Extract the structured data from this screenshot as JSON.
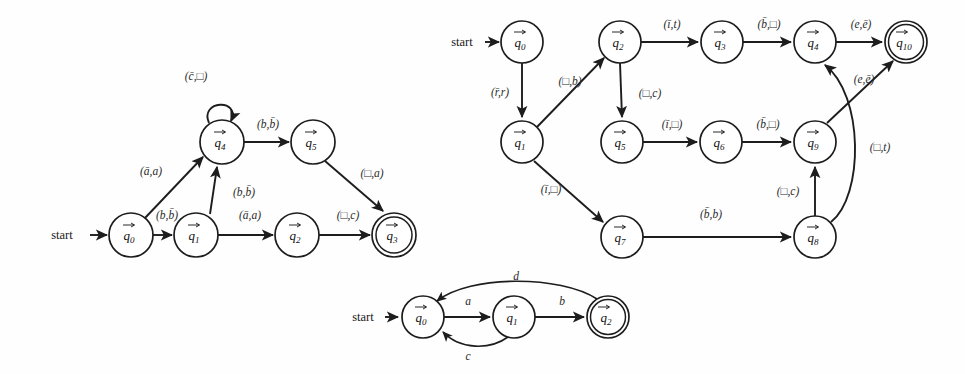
{
  "page": {
    "background": "#fefefe",
    "ink": "#1d1d1d",
    "width": 965,
    "height": 374,
    "caption": ""
  },
  "common": {
    "start_label": "start",
    "state_prefix": "q",
    "blank_symbol": "□"
  },
  "diagrams": [
    {
      "id": "left-automaton",
      "name": "turing-machine-left",
      "title": "",
      "start_state": "q0",
      "accepting_states": [
        "q3"
      ],
      "start_label": "start",
      "states": [
        {
          "id": "q0",
          "label": "q",
          "sub": "0",
          "x": 131,
          "y": 235,
          "r": 22,
          "accepting": false
        },
        {
          "id": "q1",
          "label": "q",
          "sub": "1",
          "x": 196,
          "y": 235,
          "r": 22,
          "accepting": false
        },
        {
          "id": "q2",
          "label": "q",
          "sub": "2",
          "x": 297,
          "y": 235,
          "r": 22,
          "accepting": false
        },
        {
          "id": "q3",
          "label": "q",
          "sub": "3",
          "x": 394,
          "y": 235,
          "r": 22,
          "accepting": true
        },
        {
          "id": "q4",
          "label": "q",
          "sub": "4",
          "x": 222,
          "y": 142,
          "r": 22,
          "accepting": false
        },
        {
          "id": "q5",
          "label": "q",
          "sub": "5",
          "x": 313,
          "y": 142,
          "r": 22,
          "accepting": false
        }
      ],
      "transitions": [
        {
          "from": "q4",
          "to": "q4",
          "label": "(c̄,□)",
          "read": "c̄",
          "write": "□",
          "kind": "self-loop",
          "lx": 196,
          "ly": 77
        },
        {
          "from": "q0",
          "to": "q4",
          "label": "(ā,a)",
          "read": "ā",
          "write": "a",
          "kind": "line",
          "lx": 151,
          "ly": 172
        },
        {
          "from": "q0",
          "to": "q1",
          "label": "(b,b̄)",
          "read": "b",
          "write": "b̄",
          "kind": "line",
          "lx": 167,
          "ly": 216
        },
        {
          "from": "q1",
          "to": "q4",
          "label": "(b,b̄)",
          "read": "b",
          "write": "b̄",
          "kind": "line",
          "lx": 242,
          "ly": 193
        },
        {
          "from": "q1",
          "to": "q2",
          "label": "(ā,a)",
          "read": "ā",
          "write": "a",
          "kind": "line",
          "lx": 250,
          "ly": 216
        },
        {
          "from": "q4",
          "to": "q5",
          "label": "(b,b̄)",
          "read": "b",
          "write": "b̄",
          "kind": "line",
          "lx": 268,
          "ly": 125
        },
        {
          "from": "q5",
          "to": "q3",
          "label": "(□,a)",
          "read": "□",
          "write": "a",
          "kind": "line",
          "lx": 371,
          "ly": 175
        },
        {
          "from": "q2",
          "to": "q3",
          "label": "(□,c)",
          "read": "□",
          "write": "c",
          "kind": "line",
          "lx": 349,
          "ly": 216
        }
      ]
    },
    {
      "id": "right-automaton",
      "name": "turing-machine-right",
      "title": "",
      "start_state": "q0",
      "accepting_states": [
        "q10"
      ],
      "start_label": "start",
      "states": [
        {
          "id": "q0",
          "label": "q",
          "sub": "0",
          "x": 522,
          "y": 42,
          "r": 21,
          "accepting": false
        },
        {
          "id": "q1",
          "label": "q",
          "sub": "1",
          "x": 522,
          "y": 142,
          "r": 21,
          "accepting": false
        },
        {
          "id": "q2",
          "label": "q",
          "sub": "2",
          "x": 620,
          "y": 42,
          "r": 21,
          "accepting": false
        },
        {
          "id": "q3",
          "label": "q",
          "sub": "3",
          "x": 722,
          "y": 42,
          "r": 21,
          "accepting": false
        },
        {
          "id": "q4",
          "label": "q",
          "sub": "4",
          "x": 815,
          "y": 42,
          "r": 21,
          "accepting": false
        },
        {
          "id": "q10",
          "label": "q",
          "sub": "10",
          "x": 906,
          "y": 42,
          "r": 21,
          "accepting": true
        },
        {
          "id": "q5",
          "label": "q",
          "sub": "5",
          "x": 622,
          "y": 142,
          "r": 21,
          "accepting": false
        },
        {
          "id": "q6",
          "label": "q",
          "sub": "6",
          "x": 721,
          "y": 142,
          "r": 21,
          "accepting": false
        },
        {
          "id": "q9",
          "label": "q",
          "sub": "9",
          "x": 815,
          "y": 142,
          "r": 21,
          "accepting": false
        },
        {
          "id": "q7",
          "label": "q",
          "sub": "7",
          "x": 622,
          "y": 237,
          "r": 21,
          "accepting": false
        },
        {
          "id": "q8",
          "label": "q",
          "sub": "8",
          "x": 815,
          "y": 237,
          "r": 21,
          "accepting": false
        }
      ],
      "transitions": [
        {
          "from": "q0",
          "to": "q1",
          "label": "(r̄,r)",
          "read": "r̄",
          "write": "r",
          "kind": "line",
          "lx": 500,
          "ly": 93
        },
        {
          "from": "q1",
          "to": "q2",
          "label": "(□,b)",
          "read": "□",
          "write": "b",
          "kind": "line",
          "lx": 570,
          "ly": 82
        },
        {
          "from": "q2",
          "to": "q3",
          "label": "(ī,t)",
          "read": "ī",
          "write": "t",
          "kind": "line",
          "lx": 672,
          "ly": 25
        },
        {
          "from": "q3",
          "to": "q4",
          "label": "(b̄,□)",
          "read": "b̄",
          "write": "□",
          "kind": "line",
          "lx": 769,
          "ly": 25
        },
        {
          "from": "q4",
          "to": "q10",
          "label": "(e,ē)",
          "read": "e",
          "write": "ē",
          "kind": "line",
          "lx": 861,
          "ly": 25
        },
        {
          "from": "q2",
          "to": "q5",
          "label": "(□,c)",
          "read": "□",
          "write": "c",
          "kind": "line",
          "lx": 648,
          "ly": 94
        },
        {
          "from": "q5",
          "to": "q6",
          "label": "(ī,□)",
          "read": "ī",
          "write": "□",
          "kind": "line",
          "lx": 672,
          "ly": 126
        },
        {
          "from": "q6",
          "to": "q9",
          "label": "(b̄,□)",
          "read": "b̄",
          "write": "□",
          "kind": "line",
          "lx": 768,
          "ly": 126
        },
        {
          "from": "q9",
          "to": "q10",
          "label": "(e,ē)",
          "read": "e",
          "write": "ē",
          "kind": "line",
          "lx": 862,
          "ly": 80
        },
        {
          "from": "q1",
          "to": "q7",
          "label": "(ī,□)",
          "read": "ī",
          "write": "□",
          "kind": "line",
          "lx": 551,
          "ly": 190
        },
        {
          "from": "q7",
          "to": "q8",
          "label": "(b̄,b)",
          "read": "b̄",
          "write": "b",
          "kind": "line",
          "lx": 711,
          "ly": 215
        },
        {
          "from": "q8",
          "to": "q9",
          "label": "(□,c)",
          "read": "□",
          "write": "c",
          "kind": "line",
          "lx": 788,
          "ly": 192
        },
        {
          "from": "q8",
          "to": "q4",
          "label": "(□,t)",
          "read": "□",
          "write": "t",
          "kind": "curve",
          "lx": 873,
          "ly": 148
        }
      ]
    },
    {
      "id": "bottom-automaton",
      "name": "finite-automaton-bottom",
      "title": "",
      "start_state": "q0",
      "accepting_states": [
        "q2"
      ],
      "start_label": "start",
      "states": [
        {
          "id": "q0",
          "label": "q",
          "sub": "0",
          "x": 423,
          "y": 317,
          "r": 21,
          "accepting": false
        },
        {
          "id": "q1",
          "label": "q",
          "sub": "1",
          "x": 514,
          "y": 317,
          "r": 21,
          "accepting": false
        },
        {
          "id": "q2",
          "label": "q",
          "sub": "2",
          "x": 608,
          "y": 317,
          "r": 21,
          "accepting": true
        }
      ],
      "transitions": [
        {
          "from": "q0",
          "to": "q1",
          "label": "a",
          "kind": "line",
          "lx": 468,
          "ly": 303
        },
        {
          "from": "q1",
          "to": "q2",
          "label": "b",
          "kind": "line",
          "lx": 562,
          "ly": 303
        },
        {
          "from": "q1",
          "to": "q0",
          "label": "c",
          "kind": "curve-below",
          "lx": 468,
          "ly": 348
        },
        {
          "from": "q2",
          "to": "q0",
          "label": "d",
          "kind": "curve-above",
          "lx": 515,
          "ly": 281
        }
      ]
    }
  ]
}
